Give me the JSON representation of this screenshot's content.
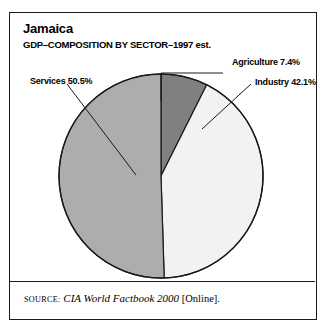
{
  "figure": {
    "title": "Jamaica",
    "subtitle": "GDP–COMPOSITION BY SECTOR–1997 est.",
    "border_color": "#1a1a1a",
    "background": "#ffffff"
  },
  "labels": {
    "agriculture": "Agriculture 7.4%",
    "industry": "Industry 42.1%",
    "services": "Services 50.5%"
  },
  "source": {
    "label": "Source:",
    "work": "CIA World Factbook 2000",
    "medium": "[Online]."
  },
  "chart_data": {
    "type": "pie",
    "title": "Jamaica",
    "subtitle": "GDP–COMPOSITION BY SECTOR–1997 est.",
    "xlabel": "",
    "ylabel": "",
    "unit": "percent",
    "start_angle_deg": 0,
    "direction": "clockwise",
    "legend": "callout-labels",
    "grid": false,
    "categories": [
      "Agriculture",
      "Industry",
      "Services"
    ],
    "values": [
      7.4,
      42.1,
      50.5
    ],
    "colors": [
      "#808080",
      "#f2f2f2",
      "#adadad"
    ],
    "slice_edge_color": "#1a1a1a",
    "slices": [
      {
        "name": "Agriculture",
        "value": 7.4,
        "label": "Agriculture 7.4%",
        "color": "#808080",
        "start_deg": 0.0,
        "end_deg": 26.6
      },
      {
        "name": "Industry",
        "value": 42.1,
        "label": "Industry 42.1%",
        "color": "#f2f2f2",
        "start_deg": 26.6,
        "end_deg": 178.2
      },
      {
        "name": "Services",
        "value": 50.5,
        "label": "Services 50.5%",
        "color": "#adadad",
        "start_deg": 178.2,
        "end_deg": 360.0
      }
    ]
  }
}
